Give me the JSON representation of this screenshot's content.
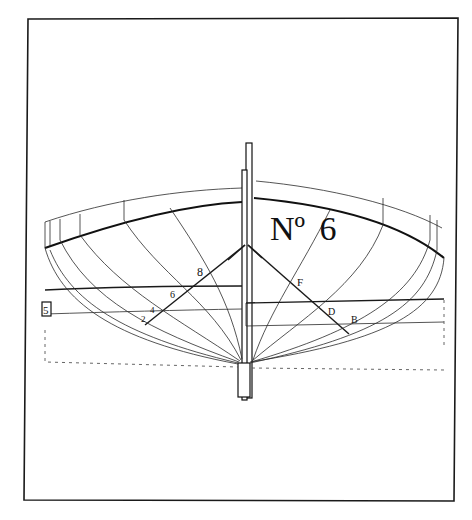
{
  "plate": {
    "title_prefix": "Nº",
    "title_number": "6",
    "station_labels_left": [
      "8",
      "6",
      "4",
      "2"
    ],
    "station_labels_right": [
      "F",
      "D",
      "B"
    ],
    "margin_label": "5"
  },
  "colors": {
    "paper": "#ffffff",
    "ink": "#111111"
  }
}
